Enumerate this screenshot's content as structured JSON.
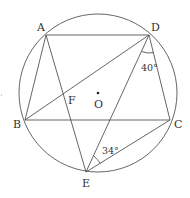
{
  "figure": {
    "type": "inscribed-circle-geometry",
    "circle": {
      "center_label": "O",
      "cx": 98,
      "cy": 93,
      "r": 79
    },
    "points": {
      "A": {
        "label": "A",
        "x": 46,
        "y": 35
      },
      "D": {
        "label": "D",
        "x": 149,
        "y": 35
      },
      "B": {
        "label": "B",
        "x": 25,
        "y": 120
      },
      "C": {
        "label": "C",
        "x": 170,
        "y": 120
      },
      "E": {
        "label": "E",
        "x": 86,
        "y": 172
      },
      "F": {
        "label": "F"
      },
      "O": {
        "label": "O"
      }
    },
    "segments": [
      "AD",
      "AB",
      "AE",
      "BD",
      "BC",
      "DE",
      "DC",
      "CE"
    ],
    "angles": {
      "angle_EDC": {
        "label": "40°",
        "vertex": "D"
      },
      "angle_DEC": {
        "label": "34°",
        "vertex": "E"
      }
    },
    "stroke_color": "#555555"
  }
}
